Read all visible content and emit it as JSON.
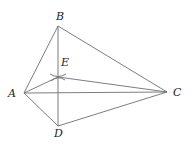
{
  "diagram": {
    "points": {
      "A": {
        "x": 24,
        "y": 93,
        "label": "A",
        "lx": 8,
        "ly": 97
      },
      "B": {
        "x": 58,
        "y": 26,
        "label": "B",
        "lx": 56,
        "ly": 20
      },
      "C": {
        "x": 167,
        "y": 92,
        "label": "C",
        "lx": 173,
        "ly": 96
      },
      "D": {
        "x": 58,
        "y": 126,
        "label": "D",
        "lx": 54,
        "ly": 137
      },
      "E": {
        "x": 58,
        "y": 77,
        "label": "E",
        "lx": 61,
        "ly": 66
      }
    },
    "segments": [
      [
        "A",
        "B"
      ],
      [
        "B",
        "C"
      ],
      [
        "A",
        "C"
      ],
      [
        "A",
        "D"
      ],
      [
        "D",
        "C"
      ],
      [
        "B",
        "D"
      ],
      [
        "A",
        "E"
      ],
      [
        "E",
        "C"
      ]
    ],
    "colors": {
      "line": "#6e6e6e",
      "label": "#222222"
    }
  }
}
